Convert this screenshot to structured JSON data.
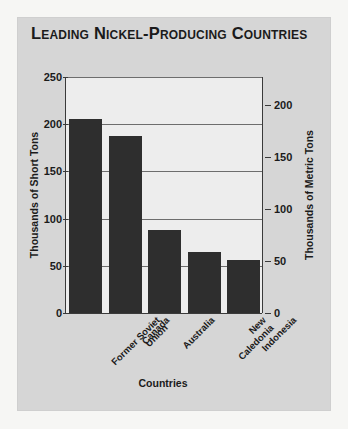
{
  "card": {
    "title": "Leading Nickel-Producing Countries"
  },
  "chart_data": {
    "type": "bar",
    "title": "Leading Nickel-Producing Countries",
    "xlabel": "Countries",
    "ylabel": "Thousands of Short Tons",
    "ylabel_right": "Thousands of Metric Tons",
    "categories": [
      "Former Soviet\nUnion",
      "Canada",
      "Australia",
      "New Caledonia",
      "Indonesia"
    ],
    "values": [
      205,
      187,
      88,
      65,
      56
    ],
    "ylim": [
      0,
      250
    ],
    "yticks": [
      0,
      50,
      100,
      150,
      200,
      250
    ],
    "ylim_right": [
      0,
      227
    ],
    "yticks_right": [
      0,
      50,
      100,
      150,
      200
    ],
    "grid": true,
    "legend": "none",
    "bar_color": "#2e2e2e",
    "plot_bg": "#ededed",
    "card_bg": "#d6d6d6"
  }
}
